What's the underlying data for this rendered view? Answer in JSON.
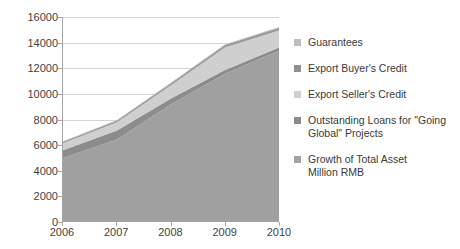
{
  "chart_data": {
    "type": "area",
    "title": "",
    "xlabel": "",
    "ylabel": "",
    "categories": [
      "2006",
      "2007",
      "2008",
      "2009",
      "2010"
    ],
    "x": [
      2006,
      2007,
      2008,
      2009,
      2010
    ],
    "ylim": [
      0,
      16000
    ],
    "yticks": [
      0,
      2000,
      4000,
      6000,
      8000,
      10000,
      12000,
      14000,
      16000
    ],
    "grid": true,
    "stacked": true,
    "legend_position": "right",
    "series": [
      {
        "name": "Growth of  Total Asset\n   Million RMB",
        "color": "#a0a0a0",
        "values": [
          4950,
          6400,
          9150,
          11550,
          13350
        ]
      },
      {
        "name": "Outstanding Loans for \"Going Global\" Projects",
        "color": "#8c8c8c",
        "values": [
          600,
          700,
          450,
          300,
          250
        ]
      },
      {
        "name": "Export Seller's Credit",
        "color": "#cfcfcf",
        "values": [
          550,
          650,
          1050,
          1750,
          1350
        ]
      },
      {
        "name": "Export Buyer's Credit",
        "color": "#9a9a9a",
        "values": [
          110,
          130,
          160,
          200,
          200
        ]
      },
      {
        "name": "Guarantees",
        "color": "#bdbdbd",
        "values": [
          40,
          50,
          60,
          70,
          70
        ]
      }
    ],
    "totals": [
      6250,
      7930,
      10870,
      13870,
      15220
    ]
  },
  "legend": {
    "items": [
      {
        "label": "Guarantees",
        "color": "#bdbdbd"
      },
      {
        "label": "Export Buyer's Credit",
        "color": "#8f8f8f"
      },
      {
        "label": "Export Seller's Credit",
        "color": "#cfcfcf"
      },
      {
        "label": "Outstanding Loans for \"Going Global\" Projects",
        "color": "#8c8c8c"
      },
      {
        "label": "Growth of  Total Asset\n   Million RMB",
        "color": "#a3a3a3"
      }
    ]
  },
  "axes": {
    "y_tick_labels": [
      "16000",
      "14000",
      "12000",
      "10000",
      "8000",
      "6000",
      "4000",
      "2000",
      "0"
    ],
    "x_tick_labels": [
      "2006",
      "2007",
      "2008",
      "2009",
      "2010"
    ]
  },
  "colors": {
    "grid": "#d4d4d4",
    "axis": "#a6a6a6",
    "text": "#3f3f3f",
    "background": "#ffffff"
  }
}
